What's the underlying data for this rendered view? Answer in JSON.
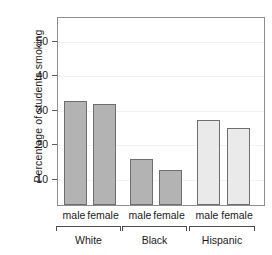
{
  "chart_data": {
    "type": "bar",
    "title": "",
    "xlabel": "",
    "ylabel": "Percentage of students smoking",
    "ylim": [
      2,
      57
    ],
    "yticks": [
      10,
      20,
      30,
      40,
      50
    ],
    "ytick_labels": [
      "10",
      "20",
      "30",
      "40",
      "50"
    ],
    "grid": true,
    "legend": false,
    "categories": [
      "male",
      "female",
      "male",
      "female",
      "male",
      "female"
    ],
    "groups": [
      {
        "label": "White",
        "members": [
          "male",
          "female"
        ],
        "values": [
          32.3,
          31.4
        ],
        "color": "#b3b3b3"
      },
      {
        "label": "Black",
        "members": [
          "male",
          "female"
        ],
        "values": [
          15.3,
          12.2
        ],
        "color": "#b3b3b3"
      },
      {
        "label": "Hispanic",
        "members": [
          "male",
          "female"
        ],
        "values": [
          26.6,
          24.5
        ],
        "color": "#eaeaea"
      }
    ],
    "values": [
      32.3,
      31.4,
      15.3,
      12.2,
      26.6,
      24.5
    ],
    "bar_edge_color": "#6e6e6e",
    "frame_color": "#8d8d8d",
    "gridline_color": "#f2f2f2",
    "text_color": "#1a1a1a"
  },
  "axes": {
    "y_title": "Percentage of students smoking",
    "ticks": [
      {
        "label": "50",
        "value": 50
      },
      {
        "label": "40",
        "value": 40
      },
      {
        "label": "30",
        "value": 30
      },
      {
        "label": "20",
        "value": 20
      },
      {
        "label": "10",
        "value": 10
      }
    ]
  },
  "bars": [
    {
      "name": "white-male",
      "label": "male",
      "value": 32.3,
      "color": "#b3b3b3"
    },
    {
      "name": "white-female",
      "label": "female",
      "value": 31.4,
      "color": "#b3b3b3"
    },
    {
      "name": "black-male",
      "label": "male",
      "value": 15.3,
      "color": "#b3b3b3"
    },
    {
      "name": "black-female",
      "label": "female",
      "value": 12.2,
      "color": "#b3b3b3"
    },
    {
      "name": "hispanic-male",
      "label": "male",
      "value": 26.6,
      "color": "#eaeaea"
    },
    {
      "name": "hispanic-female",
      "label": "female",
      "value": 24.5,
      "color": "#eaeaea"
    }
  ],
  "group_labels": [
    {
      "name": "white",
      "label": "White"
    },
    {
      "name": "black",
      "label": "Black"
    },
    {
      "name": "hispanic",
      "label": "Hispanic"
    }
  ]
}
